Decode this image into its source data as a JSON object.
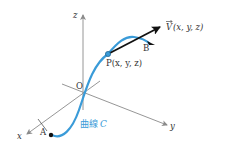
{
  "diagram": {
    "type": "3d-space-curve-with-tangent-vector",
    "axes": {
      "x_label": "x",
      "y_label": "y",
      "z_label": "z",
      "origin_label": "O"
    },
    "curve": {
      "label": "曲線C",
      "label_prefix": "曲線",
      "label_var": "C",
      "color": "#3a9bd8",
      "start_point_label": "A",
      "end_point_label": "B"
    },
    "point": {
      "label": "P(x, y, z)",
      "color": "#3a9bd8"
    },
    "vector": {
      "label": "V(x, y, z)",
      "symbol": "V",
      "args": "(x, y, z)",
      "color": "#111111"
    },
    "colors": {
      "axis": "#8a8a8a",
      "curve": "#3a9bd8",
      "vector": "#111111",
      "text": "#333333"
    }
  }
}
